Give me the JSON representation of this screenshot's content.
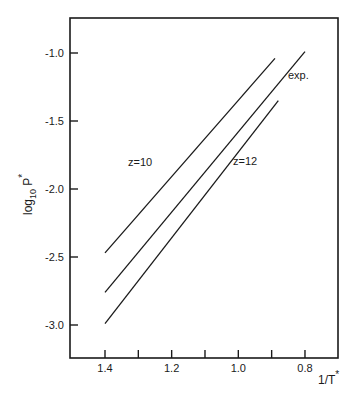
{
  "chart_data": {
    "type": "line",
    "title": "",
    "xlabel": "1/T*",
    "ylabel": "log10 P*",
    "xlim": [
      1.5,
      0.7
    ],
    "ylim": [
      -3.25,
      -0.75
    ],
    "x_reversed": true,
    "grid": false,
    "legend": "none (inline annotations)",
    "x_ticks": [
      1.4,
      1.3,
      1.2,
      1.1,
      1.0,
      0.9,
      0.8
    ],
    "x_tick_labels": [
      "1.4",
      "",
      "1.2",
      "",
      "1.0",
      "",
      "0.8"
    ],
    "y_ticks": [
      -1.0,
      -1.5,
      -2.0,
      -2.5,
      -3.0
    ],
    "y_tick_labels": [
      "-1.0",
      "-1.5",
      "-2.0",
      "-2.5",
      "-3.0"
    ],
    "series": [
      {
        "name": "z=10",
        "x": [
          1.4,
          0.89
        ],
        "y": [
          -2.47,
          -1.04
        ]
      },
      {
        "name": "exp.",
        "x": [
          1.4,
          0.8
        ],
        "y": [
          -2.76,
          -0.99
        ]
      },
      {
        "name": "z=12",
        "x": [
          1.4,
          0.88
        ],
        "y": [
          -2.99,
          -1.35
        ]
      }
    ],
    "annotations": [
      "z=10",
      "exp.",
      "z=12"
    ]
  },
  "labels": {
    "xlabel_main": "1/T",
    "xlabel_sup": "*",
    "ylabel_main": "log",
    "ylabel_sub": "10",
    "ylabel_var": " P",
    "ylabel_sup": "*",
    "annot_z10": "z=10",
    "annot_exp": "exp.",
    "annot_z12": "z=12"
  }
}
